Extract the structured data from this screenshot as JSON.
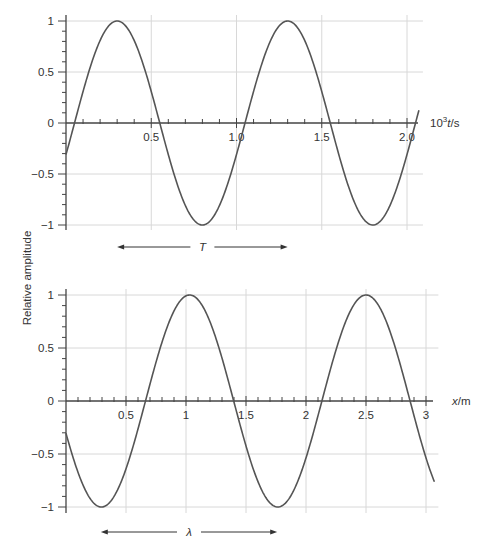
{
  "ylabel": "Relative amplitude",
  "colors": {
    "curve": "#555555",
    "axis": "#444444",
    "grid": "#d8d8d8",
    "text": "#333333"
  },
  "chart_data": [
    {
      "type": "line",
      "title": "",
      "xlabel_prefix": "10",
      "xlabel_sup": "3",
      "xlabel_var": "t",
      "xlabel_suffix": "/s",
      "ylabel": "Relative amplitude",
      "xlim": [
        0,
        2.07
      ],
      "ylim": [
        -1,
        1
      ],
      "xticks": [
        0.5,
        1.0,
        1.5,
        2.0
      ],
      "xtick_labels": [
        "0.5",
        "1.0",
        "1.5",
        "2.0"
      ],
      "yticks": [
        1,
        0.5,
        0,
        -0.5,
        -1
      ],
      "ytick_labels": [
        "1",
        "0.5",
        "0",
        "−0.5",
        "−1"
      ],
      "grid": true,
      "series": [
        {
          "name": "displacement vs time",
          "function": "sin(2*pi*(t - 0.05)/1.0)",
          "period": 1.0,
          "phase_shift": 0.05,
          "x": [
            0,
            0.05,
            0.3,
            0.55,
            0.8,
            1.05,
            1.3,
            1.55,
            1.8,
            2.05,
            2.07
          ],
          "values": [
            -0.31,
            0,
            1,
            0,
            -1,
            0,
            1,
            0,
            -1,
            0,
            0.13
          ]
        }
      ],
      "annotation": {
        "label": "T",
        "from": 0.3,
        "to": 1.3,
        "meaning": "period"
      }
    },
    {
      "type": "line",
      "title": "",
      "xlabel_var": "x",
      "xlabel_suffix": "/m",
      "ylabel": "Relative amplitude",
      "xlim": [
        0,
        3.07
      ],
      "ylim": [
        -1,
        1
      ],
      "xticks": [
        0.5,
        1,
        1.5,
        2,
        2.5,
        3
      ],
      "xtick_labels": [
        "0.5",
        "1",
        "1.5",
        "2",
        "2.5",
        "3"
      ],
      "yticks": [
        1,
        0.5,
        0,
        -0.5,
        -1
      ],
      "ytick_labels": [
        "1",
        "0.5",
        "0",
        "−0.5",
        "−1"
      ],
      "grid": true,
      "series": [
        {
          "name": "displacement vs position",
          "function": "cos(2*pi*(x - 1.03)/1.47)",
          "wavelength": 1.47,
          "peak_at": 1.03,
          "x": [
            0,
            0.295,
            0.665,
            1.03,
            1.395,
            1.765,
            2.13,
            2.5,
            2.865,
            3.07
          ],
          "values": [
            -0.31,
            -1,
            0,
            1,
            0,
            -1,
            0,
            1,
            0,
            -0.83
          ]
        }
      ],
      "annotation": {
        "label": "λ",
        "from": 0.29,
        "to": 1.76,
        "meaning": "wavelength"
      }
    }
  ]
}
